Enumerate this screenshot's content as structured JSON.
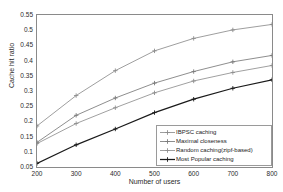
{
  "chart_data": {
    "type": "line",
    "title": "",
    "xlabel": "Number of users",
    "ylabel": "Cache hit ratio",
    "x": [
      200,
      300,
      400,
      500,
      600,
      700,
      800
    ],
    "xlim": [
      200,
      800
    ],
    "ylim": [
      0.05,
      0.55
    ],
    "xticks": [
      "200",
      "300",
      "400",
      "500",
      "600",
      "700",
      "800"
    ],
    "yticks": [
      "0.05",
      "0.1",
      "0.15",
      "0.2",
      "0.25",
      "0.3",
      "0.35",
      "0.4",
      "0.45",
      "0.5",
      "0.55"
    ],
    "grid": false,
    "legend_position": "lower right",
    "series": [
      {
        "name": "IBPSC caching",
        "values": [
          0.185,
          0.285,
          0.367,
          0.432,
          0.473,
          0.501,
          0.519
        ],
        "color": "#8c8c8c",
        "marker": "plus"
      },
      {
        "name": "Maximal closeness",
        "values": [
          0.131,
          0.22,
          0.277,
          0.326,
          0.364,
          0.396,
          0.417
        ],
        "color": "#7a7a7a",
        "marker": "plus"
      },
      {
        "name": "Random caching(zipf-based)",
        "values": [
          0.127,
          0.193,
          0.245,
          0.294,
          0.333,
          0.361,
          0.384
        ],
        "color": "#8f8f8f",
        "marker": "plus"
      },
      {
        "name": "Most Popular caching",
        "values": [
          0.062,
          0.123,
          0.175,
          0.229,
          0.273,
          0.309,
          0.337
        ],
        "color": "#1a1a1a",
        "marker": "plus"
      }
    ]
  }
}
